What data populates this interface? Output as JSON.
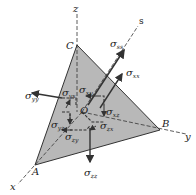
{
  "figure": {
    "type": "tetrahedron stress element diagram",
    "colors": {
      "face_fill": "#b8b8b8",
      "line": "#333333",
      "background": "#ffffff"
    },
    "axes": [
      {
        "name": "z",
        "label": "z"
      },
      {
        "name": "s",
        "label": "s"
      },
      {
        "name": "y",
        "label": "y"
      },
      {
        "name": "x",
        "label": "x"
      }
    ],
    "points": {
      "A": "A",
      "B": "B",
      "C": "C",
      "O": "O"
    },
    "stresses": {
      "sigma_ss": {
        "sym": "σ",
        "sub": "ss"
      },
      "sigma_xx": {
        "sym": "σ",
        "sub": "xx"
      },
      "sigma_yy": {
        "sym": "σ",
        "sub": "yy"
      },
      "sigma_xy": {
        "sym": "σ",
        "sub": "xy"
      },
      "sigma_yx": {
        "sym": "σ",
        "sub": "yx"
      },
      "sigma_yz": {
        "sym": "σ",
        "sub": "yz"
      },
      "sigma_xz": {
        "sym": "σ",
        "sub": "xz"
      },
      "sigma_zx": {
        "sym": "σ",
        "sub": "zx"
      },
      "sigma_zy": {
        "sym": "σ",
        "sub": "zy"
      },
      "sigma_zz": {
        "sym": "σ",
        "sub": "zz"
      }
    }
  }
}
